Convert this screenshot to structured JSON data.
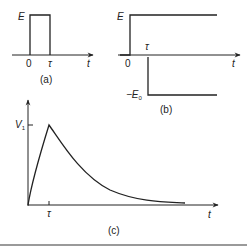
{
  "panels": {
    "a": {
      "caption": "(a)",
      "level_label": "E",
      "origin_label": "0",
      "tau_label": "τ",
      "axis_label": "t"
    },
    "b": {
      "caption": "(b)",
      "level_label": "E",
      "neg_level_label": "−E",
      "neg_level_sub": "0",
      "origin_label": "0",
      "tau_label": "τ",
      "axis_label": "t"
    },
    "c": {
      "caption": "(c)",
      "peak_label": "V",
      "peak_sub": "1",
      "tau_label": "τ",
      "axis_label": "t"
    }
  },
  "colors": {
    "ink": "#222222",
    "background": "#ffffff",
    "footer_bar": "#9a9a9a"
  }
}
